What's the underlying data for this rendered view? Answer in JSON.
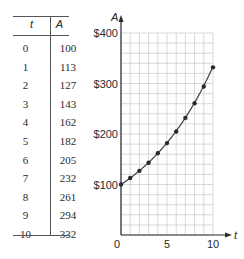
{
  "table": {
    "headers": [
      "t",
      "A"
    ],
    "rows": [
      {
        "t": "0",
        "A": "100"
      },
      {
        "t": "1",
        "A": "113"
      },
      {
        "t": "2",
        "A": "127"
      },
      {
        "t": "3",
        "A": "143"
      },
      {
        "t": "4",
        "A": "162"
      },
      {
        "t": "5",
        "A": "182"
      },
      {
        "t": "6",
        "A": "205"
      },
      {
        "t": "7",
        "A": "232"
      },
      {
        "t": "8",
        "A": "261"
      },
      {
        "t": "9",
        "A": "294"
      },
      {
        "t": "10",
        "A": "332"
      }
    ]
  },
  "chart_data": {
    "type": "scatter",
    "title": "",
    "xlabel": "t",
    "ylabel": "A",
    "x": [
      0,
      1,
      2,
      3,
      4,
      5,
      6,
      7,
      8,
      9,
      10
    ],
    "series": [
      {
        "name": "A (data points)",
        "values": [
          100,
          113,
          127,
          143,
          162,
          182,
          205,
          232,
          261,
          294,
          332
        ]
      },
      {
        "name": "A fitted curve",
        "style": "line",
        "values": [
          100,
          112.8,
          127.2,
          143.5,
          161.8,
          182.5,
          205.9,
          232.2,
          261.9,
          295.4,
          333.2
        ]
      }
    ],
    "xticks": [
      "0",
      "5",
      "10"
    ],
    "yticks": [
      "$100",
      "$200",
      "$300",
      "$400"
    ],
    "xlim": [
      0,
      10
    ],
    "ylim": [
      0,
      400
    ],
    "grid": true,
    "grid_x_step": 1,
    "grid_y_step": 20,
    "legend": "none"
  },
  "colors": {
    "ink": "#2a2a2a",
    "grid": "#c8c8c8",
    "curve": "#4a4a4a"
  }
}
